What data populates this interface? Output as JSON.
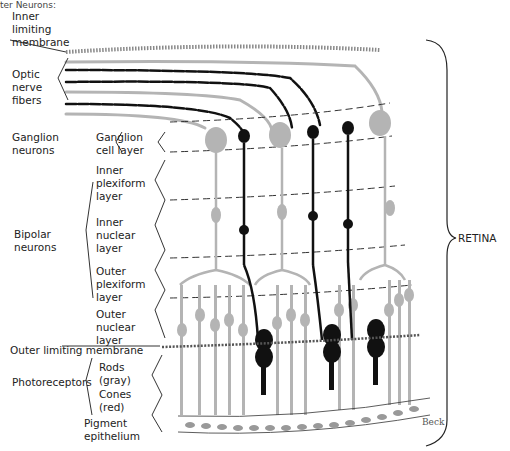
{
  "cut_text": "ter Neurons:",
  "labels": {
    "inner_limiting_membrane": "Inner\nlimiting\nmembrane",
    "optic_nerve_fibers": "Optic\nnerve\nfibers",
    "ganglion_neurons": "Ganglion\nneurons",
    "ganglion_cell_layer": "Ganglion\ncell layer",
    "inner_plexiform_layer": "Inner\nplexiform\nlayer",
    "bipolar_neurons": "Bipolar\nneurons",
    "inner_nuclear_layer": "Inner\nnuclear\nlayer",
    "outer_plexiform_layer": "Outer\nplexiform\nlayer",
    "outer_nuclear_layer": "Outer\nnuclear\nlayer",
    "outer_limiting_membrane": "Outer limiting membrane",
    "photoreceptors": "Photoreceptors",
    "rods": "Rods\n(gray)",
    "cones": "Cones\n(red)",
    "pigment_epithelium": "Pigment\nepithelium",
    "retina": "RETINA"
  },
  "signature": "Beck",
  "colors": {
    "rod_gray": "#b4b4b4",
    "cone_black": "#111111",
    "line": "#222222"
  }
}
